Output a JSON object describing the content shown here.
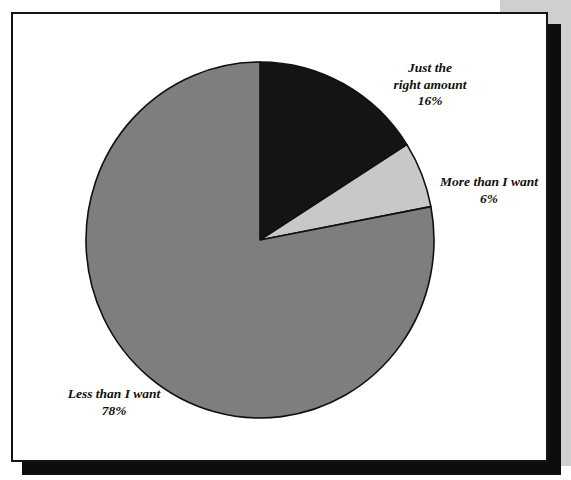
{
  "page": {
    "background_color": "#ffffff",
    "scan_background_color": "#cfcfcf",
    "panel_border_color": "#141414",
    "panel_shadow_color": "#0d0d0d"
  },
  "chart_data": {
    "type": "pie",
    "title": "",
    "title_fragment": "",
    "categories": [
      "Just the right amount",
      "More than I want",
      "Less than I want"
    ],
    "values": [
      16,
      6,
      78
    ],
    "value_labels": [
      "16%",
      "6%",
      "78%"
    ],
    "units": "%",
    "start_angle_deg": 0,
    "direction": "clockwise",
    "colors": [
      "#141414",
      "#c8c8c8",
      "#7e7e7e"
    ],
    "slices": [
      {
        "label": "Just the right amount",
        "label_line1": "Just the",
        "label_line2": "right amount",
        "value": 16,
        "value_label": "16%",
        "color": "#141414",
        "start_deg": 0,
        "end_deg": 57.6
      },
      {
        "label": "More than I want",
        "label_line1": "More than I want",
        "label_line2": "",
        "value": 6,
        "value_label": "6%",
        "color": "#c8c8c8",
        "start_deg": 57.6,
        "end_deg": 79.2
      },
      {
        "label": "Less than I want",
        "label_line1": "Less than I want",
        "label_line2": "",
        "value": 78,
        "value_label": "78%",
        "color": "#7e7e7e",
        "start_deg": 79.2,
        "end_deg": 360
      }
    ],
    "legend_position": "callout-labels",
    "grid": false,
    "xlabel": "",
    "ylabel": ""
  },
  "labels": {
    "just_right": {
      "line1": "Just the",
      "line2": "right amount",
      "value": "16%"
    },
    "more_than": {
      "line1": "More than I want",
      "value": "6%"
    },
    "less_than": {
      "line1": "Less than I want",
      "value": "78%"
    }
  }
}
